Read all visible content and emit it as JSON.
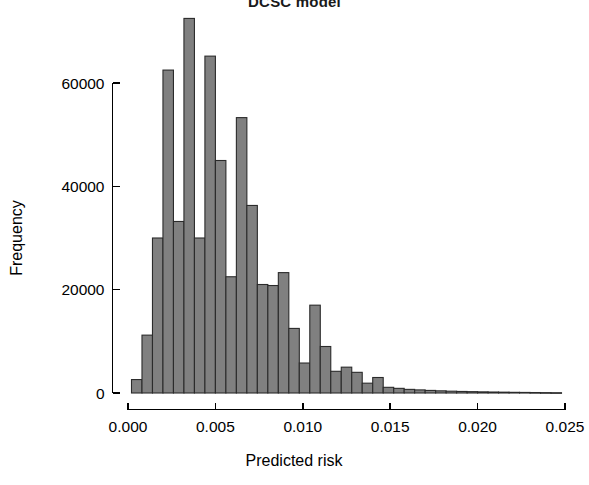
{
  "chart_data": {
    "type": "bar",
    "title": "DCSC model",
    "xlabel": "Predicted risk",
    "ylabel": "Frequency",
    "xlim": [
      0.0,
      0.025
    ],
    "ylim": [
      0,
      72500
    ],
    "grid": false,
    "legend": null,
    "bin_width": 0.0006,
    "bar_fill_color": "#808080",
    "bar_edge_color": "#2b2b2b",
    "x_ticks": [
      0.0,
      0.005,
      0.01,
      0.015,
      0.02,
      0.025
    ],
    "x_tick_labels": [
      "0.000",
      "0.005",
      "0.010",
      "0.015",
      "0.020",
      "0.025"
    ],
    "y_ticks": [
      0,
      20000,
      40000,
      60000
    ],
    "y_tick_labels": [
      "0",
      "20000",
      "40000",
      "60000"
    ],
    "bins": [
      {
        "x0": 0.0002,
        "x1": 0.0008,
        "value": 2600
      },
      {
        "x0": 0.0008,
        "x1": 0.0014,
        "value": 11200
      },
      {
        "x0": 0.0014,
        "x1": 0.002,
        "value": 30000
      },
      {
        "x0": 0.002,
        "x1": 0.0026,
        "value": 62500
      },
      {
        "x0": 0.0026,
        "x1": 0.0032,
        "value": 33200
      },
      {
        "x0": 0.0032,
        "x1": 0.0038,
        "value": 72500
      },
      {
        "x0": 0.0038,
        "x1": 0.0044,
        "value": 30000
      },
      {
        "x0": 0.0044,
        "x1": 0.005,
        "value": 65200
      },
      {
        "x0": 0.005,
        "x1": 0.0056,
        "value": 45000
      },
      {
        "x0": 0.0056,
        "x1": 0.0062,
        "value": 22500
      },
      {
        "x0": 0.0062,
        "x1": 0.0068,
        "value": 53300
      },
      {
        "x0": 0.0068,
        "x1": 0.0074,
        "value": 36300
      },
      {
        "x0": 0.0074,
        "x1": 0.008,
        "value": 21000
      },
      {
        "x0": 0.008,
        "x1": 0.0086,
        "value": 20800
      },
      {
        "x0": 0.0086,
        "x1": 0.0092,
        "value": 23300
      },
      {
        "x0": 0.0092,
        "x1": 0.0098,
        "value": 12500
      },
      {
        "x0": 0.0098,
        "x1": 0.0104,
        "value": 5800
      },
      {
        "x0": 0.0104,
        "x1": 0.011,
        "value": 17000
      },
      {
        "x0": 0.011,
        "x1": 0.0116,
        "value": 9000
      },
      {
        "x0": 0.0116,
        "x1": 0.0122,
        "value": 4200
      },
      {
        "x0": 0.0122,
        "x1": 0.0128,
        "value": 5000
      },
      {
        "x0": 0.0128,
        "x1": 0.0134,
        "value": 4000
      },
      {
        "x0": 0.0134,
        "x1": 0.014,
        "value": 1900
      },
      {
        "x0": 0.014,
        "x1": 0.0146,
        "value": 3000
      },
      {
        "x0": 0.0146,
        "x1": 0.0152,
        "value": 1100
      },
      {
        "x0": 0.0152,
        "x1": 0.0158,
        "value": 900
      },
      {
        "x0": 0.0158,
        "x1": 0.0164,
        "value": 700
      },
      {
        "x0": 0.0164,
        "x1": 0.017,
        "value": 600
      },
      {
        "x0": 0.017,
        "x1": 0.0176,
        "value": 500
      },
      {
        "x0": 0.0176,
        "x1": 0.0182,
        "value": 420
      },
      {
        "x0": 0.0182,
        "x1": 0.0188,
        "value": 350
      },
      {
        "x0": 0.0188,
        "x1": 0.0194,
        "value": 300
      },
      {
        "x0": 0.0194,
        "x1": 0.02,
        "value": 260
      },
      {
        "x0": 0.02,
        "x1": 0.0206,
        "value": 220
      },
      {
        "x0": 0.0206,
        "x1": 0.0212,
        "value": 190
      },
      {
        "x0": 0.0212,
        "x1": 0.0218,
        "value": 160
      },
      {
        "x0": 0.0218,
        "x1": 0.0224,
        "value": 130
      },
      {
        "x0": 0.0224,
        "x1": 0.023,
        "value": 110
      },
      {
        "x0": 0.023,
        "x1": 0.0236,
        "value": 90
      },
      {
        "x0": 0.0236,
        "x1": 0.0242,
        "value": 70
      },
      {
        "x0": 0.0242,
        "x1": 0.0248,
        "value": 55
      }
    ]
  }
}
